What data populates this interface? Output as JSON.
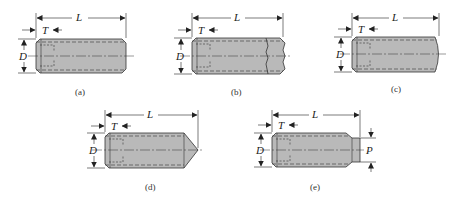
{
  "figure": {
    "colors": {
      "body": "#b9b9b9",
      "outline": "#333333",
      "dim": "#222222",
      "background": "#ffffff"
    },
    "panels": [
      {
        "id": "a",
        "caption": "(a)",
        "point_type": "flat",
        "labels": {
          "L": "L",
          "T": "T",
          "D": "D"
        }
      },
      {
        "id": "b",
        "caption": "(b)",
        "point_type": "cup",
        "labels": {
          "L": "L",
          "T": "T",
          "D": "D"
        }
      },
      {
        "id": "c",
        "caption": "(c)",
        "point_type": "oval",
        "labels": {
          "L": "L",
          "T": "T",
          "D": "D"
        }
      },
      {
        "id": "d",
        "caption": "(d)",
        "point_type": "cone",
        "labels": {
          "L": "L",
          "T": "T",
          "D": "D"
        }
      },
      {
        "id": "e",
        "caption": "(e)",
        "point_type": "dog",
        "labels": {
          "L": "L",
          "T": "T",
          "D": "D",
          "P": "P"
        }
      }
    ]
  }
}
